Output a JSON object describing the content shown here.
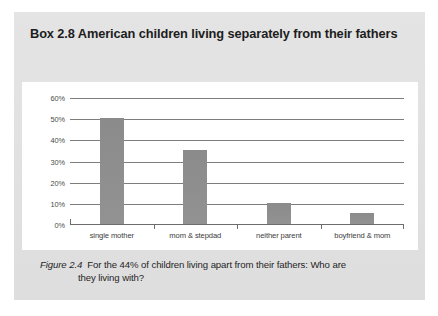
{
  "box": {
    "title": "Box 2.8  American children living separately from their fathers"
  },
  "caption": {
    "figure_label": "Figure 2.4",
    "line1": "For the 44% of children living apart from their fathers: Who are",
    "line2": "they living with?"
  },
  "colors": {
    "box_background": "#e2e2e2",
    "panel_background": "#ffffff",
    "bar_fill": "#8e8e8e",
    "gridline": "#7d7d7d",
    "axis": "#6d6d6d",
    "title_text": "#1d1d1d",
    "tick_text": "#4a4a4a"
  },
  "chart_data": {
    "type": "bar",
    "title": "",
    "categories": [
      "single mother",
      "mom & stepdad",
      "neither parent",
      "boyfriend & mom"
    ],
    "values": [
      50,
      35,
      10,
      5
    ],
    "xlabel": "",
    "ylabel": "",
    "ylim": [
      0,
      60
    ],
    "ytick_values": [
      0,
      10,
      20,
      30,
      40,
      50,
      60
    ],
    "ytick_labels": [
      "0%",
      "10%",
      "20%",
      "30%",
      "40%",
      "50%",
      "60%"
    ],
    "grid": true,
    "legend": false
  }
}
